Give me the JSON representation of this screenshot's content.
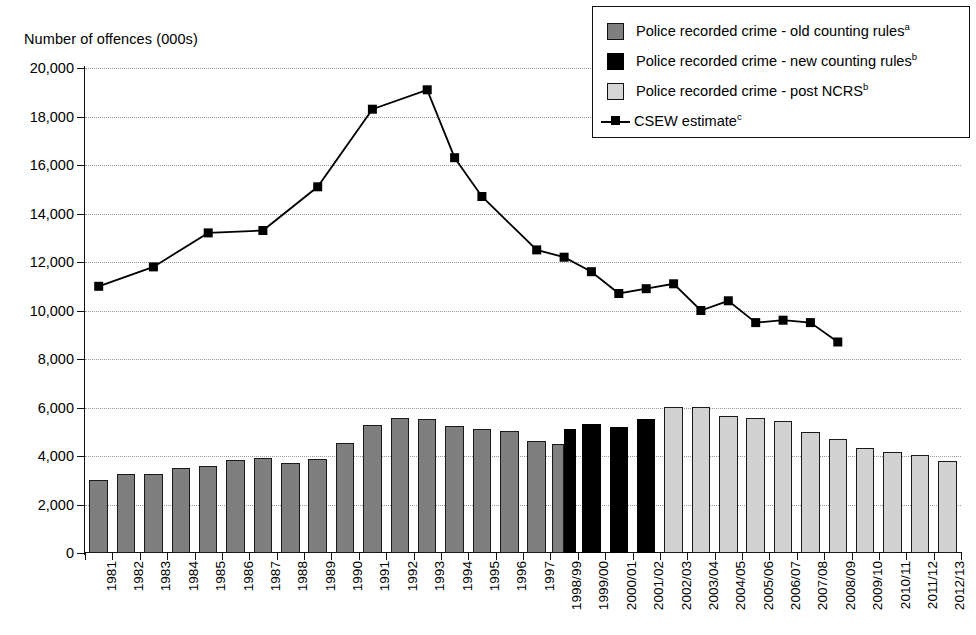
{
  "chart_data": {
    "type": "bar",
    "title": "",
    "ylabel": "Number of offences (000s)",
    "xlabel": "",
    "ylim": [
      0,
      20000
    ],
    "ytick_step": 2000,
    "ytick_labels": [
      "20,000",
      "18,000",
      "16,000",
      "14,000",
      "12,000",
      "10,000",
      "8,000",
      "6,000",
      "4,000",
      "2,000",
      "0"
    ],
    "ytick_values": [
      20000,
      18000,
      16000,
      14000,
      12000,
      10000,
      8000,
      6000,
      4000,
      2000,
      0
    ],
    "grid": "horizontal-dotted",
    "legend_position": "top-right",
    "categories": [
      "1981",
      "1982",
      "1983",
      "1984",
      "1985",
      "1986",
      "1987",
      "1988",
      "1989",
      "1990",
      "1991",
      "1992",
      "1993",
      "1994",
      "1995",
      "1996",
      "1997",
      "1998/99",
      "1999/00",
      "2000/01",
      "2001/02",
      "2002/03",
      "2003/04",
      "2004/05",
      "2005/06",
      "2006/07",
      "2007/08",
      "2008/09",
      "2009/10",
      "2010/11",
      "2011/12",
      "2012/13"
    ],
    "series": [
      {
        "name": "Police recorded crime - old counting rules",
        "style": "bar",
        "color": "#7f7f7f",
        "values": [
          3000,
          3250,
          3250,
          3500,
          3600,
          3850,
          3900,
          3730,
          3870,
          4540,
          5280,
          5580,
          5530,
          5250,
          5100,
          5020,
          4600,
          4480,
          null,
          null,
          null,
          null,
          null,
          null,
          null,
          null,
          null,
          null,
          null,
          null,
          null,
          null
        ]
      },
      {
        "name": "Police recorded crime - new counting rules",
        "style": "bar",
        "color": "#000000",
        "values": [
          null,
          null,
          null,
          null,
          null,
          null,
          null,
          null,
          null,
          null,
          null,
          null,
          null,
          null,
          null,
          null,
          null,
          5110,
          5300,
          5200,
          5520,
          null,
          null,
          null,
          null,
          null,
          null,
          null,
          null,
          null,
          null,
          null
        ]
      },
      {
        "name": "Police recorded crime - post NCRS",
        "style": "bar",
        "color": "#d2d2d2",
        "values": [
          null,
          null,
          null,
          null,
          null,
          null,
          null,
          null,
          null,
          null,
          null,
          null,
          null,
          null,
          null,
          null,
          null,
          null,
          null,
          null,
          null,
          6020,
          6020,
          5640,
          5560,
          5430,
          5000,
          4700,
          4340,
          4150,
          4050,
          3790
        ]
      },
      {
        "name": "CSEW estimate",
        "style": "line",
        "color": "#000000",
        "marker": "square",
        "values": [
          11000,
          null,
          11800,
          null,
          13200,
          null,
          13300,
          null,
          15100,
          null,
          18300,
          null,
          19100,
          16300,
          14700,
          null,
          12500,
          12200,
          11600,
          10700,
          10900,
          11100,
          10000,
          10400,
          9500,
          9600,
          9500,
          8700,
          null,
          null,
          null,
          null
        ],
        "point_categories": [
          "1981",
          "1983",
          "1985",
          "1987",
          "1989",
          "1991",
          "1993",
          "1995",
          "1997",
          "1998/99",
          "1999/00",
          "2000/01",
          "2001/02",
          "2002/03",
          "2003/04",
          "2004/05",
          "2005/06",
          "2006/07",
          "2007/08",
          "2008/09",
          "2009/10",
          "2010/11",
          "2011/12",
          "2012/13"
        ],
        "point_values": [
          11000,
          11800,
          13200,
          13300,
          15100,
          18300,
          19100,
          16300,
          14700,
          12500,
          12200,
          11600,
          10700,
          10900,
          11100,
          10000,
          10400,
          9500,
          9600,
          9500,
          8700,
          null,
          null,
          null
        ]
      }
    ]
  },
  "axis": {
    "y_title": "Number of offences (000s)"
  },
  "legend": {
    "items": [
      {
        "label": "Police recorded crime - old counting rules",
        "note": "a",
        "swatch": "old"
      },
      {
        "label": "Police recorded crime - new counting rules",
        "note": "b",
        "swatch": "new"
      },
      {
        "label": "Police recorded crime - post NCRS",
        "note": "b",
        "swatch": "post"
      },
      {
        "label": "CSEW estimate",
        "note": "c",
        "swatch": "line"
      }
    ]
  }
}
